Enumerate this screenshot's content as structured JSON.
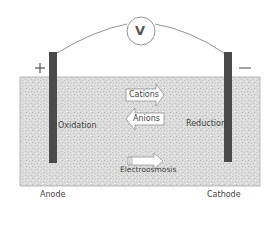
{
  "diagram": {
    "voltmeter": {
      "label": "V"
    },
    "anode": {
      "sign": "+",
      "name": "Anode",
      "process": "Oxidation"
    },
    "cathode": {
      "sign": "—",
      "name": "Cathode",
      "process": "Reduction"
    },
    "arrows": {
      "cations": {
        "label": "Cations",
        "direction": "right"
      },
      "anions": {
        "label": "Anions",
        "direction": "left"
      },
      "electroosmosis": {
        "label": "Electroosmosis",
        "direction": "right"
      }
    },
    "colors": {
      "electrode": "#4a4a4a",
      "soil": "#d8d8d8",
      "wire": "#777777",
      "text": "#444444"
    }
  }
}
